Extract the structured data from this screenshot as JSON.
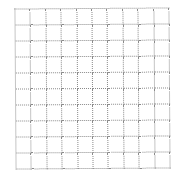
{
  "grid": {
    "rows": 10,
    "columns": 10,
    "line_color": "#8a8a8a",
    "line_style": "dotted",
    "background": "#ffffff"
  }
}
